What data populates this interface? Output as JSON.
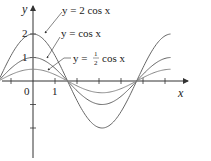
{
  "chart_data": {
    "type": "line",
    "title": "",
    "xlabel": "x",
    "ylabel": "y",
    "x_ticks": [
      1
    ],
    "x_tick_labels": [
      "0",
      "1"
    ],
    "y_ticks": [
      1,
      2,
      -1,
      -2
    ],
    "y_tick_labels": [
      "1",
      "2"
    ],
    "xlim": [
      -1.5,
      6.9
    ],
    "ylim": [
      -2.8,
      3.4
    ],
    "grid": false,
    "legend": "inline annotations with pointer arrows",
    "series": [
      {
        "name": "y = 2 cos x",
        "amplitude": 2,
        "function": "2*cos(x)",
        "x_range": [
          -1.5,
          6.28
        ]
      },
      {
        "name": "y = cos x",
        "amplitude": 1,
        "function": "cos(x)",
        "x_range": [
          -1.5,
          6.28
        ]
      },
      {
        "name": "y = 1/2 cos x",
        "amplitude": 0.5,
        "function": "0.5*cos(x)",
        "x_range": [
          -1.5,
          6.28
        ]
      }
    ],
    "annotations": [
      {
        "text": "y = 2 cos x",
        "points_to": "2 cos x curve"
      },
      {
        "text": "y = cos x",
        "points_to": "cos x curve"
      },
      {
        "text": "y = ½ cos x",
        "points_to": "1/2 cos x curve"
      }
    ]
  },
  "labels": {
    "y_axis": "y",
    "x_axis": "x",
    "origin": "0",
    "x_one": "1",
    "y_one": "1",
    "y_two": "2",
    "ann_2cos": "y = 2 cos x",
    "ann_cos": "y = cos x",
    "ann_half_prefix": "y =",
    "ann_half_num": "1",
    "ann_half_den": "2",
    "ann_half_suffix": "cos x"
  },
  "colors": {
    "axis": "#333333",
    "curve": "#666666"
  }
}
